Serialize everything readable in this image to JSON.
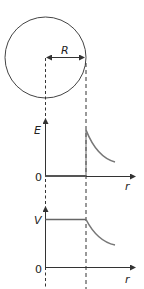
{
  "diagram": {
    "sphere": {
      "radius_label": "R"
    },
    "field_graph": {
      "y_label": "E",
      "x_label": "r",
      "origin_label": "0"
    },
    "potential_graph": {
      "y_label": "V",
      "x_label": "r",
      "origin_label": "0"
    },
    "colors": {
      "line": "#333333",
      "curve": "#777777",
      "dashed": "#333333"
    }
  }
}
